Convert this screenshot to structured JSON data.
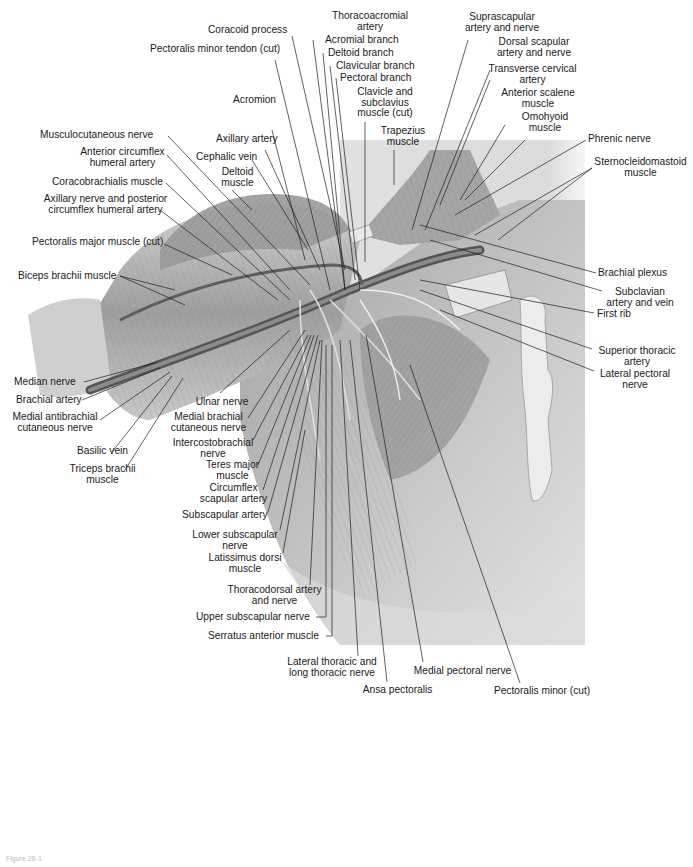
{
  "figure": {
    "caption_faint": "Figure 28-1"
  },
  "labels": [
    {
      "id": "thoracoacromial-artery",
      "text": "Thoracoacromial\nartery",
      "x": 330,
      "y": 11,
      "align": "c",
      "w": 80,
      "line": [
        [
          330,
          33
        ],
        [
          330,
          33
        ]
      ]
    },
    {
      "id": "coracoid-process",
      "text": "Coracoid process",
      "x": 208,
      "y": 25,
      "align": "r",
      "w": 110,
      "line": [
        [
          292,
          36
        ],
        [
          345,
          270
        ]
      ]
    },
    {
      "id": "pectoralis-minor-tendon-cut",
      "text": "Pectoralis minor tendon (cut)",
      "x": 150,
      "y": 44,
      "align": "r",
      "w": 140,
      "line": [
        [
          275,
          60
        ],
        [
          330,
          290
        ]
      ]
    },
    {
      "id": "acromial-branch",
      "text": "Acromial branch",
      "x": 325,
      "y": 35,
      "align": "r",
      "w": 100,
      "line": [
        [
          313,
          40
        ],
        [
          345,
          290
        ]
      ]
    },
    {
      "id": "deltoid-branch",
      "text": "Deltoid branch",
      "x": 328,
      "y": 48,
      "align": "r",
      "w": 100,
      "line": [
        [
          323,
          53
        ],
        [
          345,
          290
        ]
      ]
    },
    {
      "id": "clavicular-branch",
      "text": "Clavicular branch",
      "x": 336,
      "y": 61,
      "align": "r",
      "w": 100,
      "line": [
        [
          330,
          66
        ],
        [
          355,
          280
        ]
      ]
    },
    {
      "id": "pectoral-branch",
      "text": "Pectoral branch",
      "x": 340,
      "y": 73,
      "align": "r",
      "w": 100,
      "line": [
        [
          336,
          78
        ],
        [
          360,
          290
        ]
      ]
    },
    {
      "id": "acromion",
      "text": "Acromion",
      "x": 233,
      "y": 95,
      "align": "r",
      "w": 70,
      "line": [
        [
          272,
          130
        ],
        [
          305,
          260
        ]
      ]
    },
    {
      "id": "clavicle-subclavius-cut",
      "text": "Clavicle and\nsubclavius\nmuscle (cut)",
      "x": 345,
      "y": 87,
      "align": "c",
      "w": 80,
      "line": [
        [
          365,
          122
        ],
        [
          365,
          262
        ]
      ]
    },
    {
      "id": "trapezius-muscle",
      "text": "Trapezius\nmuscle",
      "x": 373,
      "y": 126,
      "align": "c",
      "w": 60,
      "line": [
        [
          394,
          150
        ],
        [
          394,
          185
        ]
      ]
    },
    {
      "id": "suprascapular-artery-nerve",
      "text": "Suprascapular\nartery and nerve",
      "x": 458,
      "y": 12,
      "align": "c",
      "w": 88,
      "line": [
        [
          468,
          40
        ],
        [
          412,
          230
        ]
      ]
    },
    {
      "id": "dorsal-scapular-artery-nerve",
      "text": "Dorsal scapular\nartery and nerve",
      "x": 490,
      "y": 37,
      "align": "c",
      "w": 88,
      "line": [
        [
          490,
          70
        ],
        [
          425,
          230
        ]
      ]
    },
    {
      "id": "transverse-cervical-artery",
      "text": "Transverse cervical\nartery",
      "x": 480,
      "y": 64,
      "align": "c",
      "w": 105,
      "line": [
        [
          490,
          80
        ],
        [
          440,
          205
        ]
      ]
    },
    {
      "id": "anterior-scalene-muscle",
      "text": "Anterior scalene\nmuscle",
      "x": 490,
      "y": 88,
      "align": "c",
      "w": 96,
      "line": [
        [
          505,
          125
        ],
        [
          460,
          200
        ]
      ]
    },
    {
      "id": "omohyoid-muscle",
      "text": "Omohyoid\nmuscle",
      "x": 510,
      "y": 112,
      "align": "c",
      "w": 70,
      "line": [
        [
          525,
          140
        ],
        [
          465,
          200
        ]
      ]
    },
    {
      "id": "phrenic-nerve",
      "text": "Phrenic nerve",
      "x": 588,
      "y": 134,
      "align": "r",
      "w": 90,
      "line": [
        [
          586,
          140
        ],
        [
          455,
          215
        ]
      ]
    },
    {
      "id": "sternocleidomastoid-muscle",
      "text": "Sternocleidomastoid\nmuscle",
      "x": 588,
      "y": 157,
      "align": "c",
      "w": 105,
      "line": [
        [
          592,
          168
        ],
        [
          475,
          235
        ]
      ],
      "line2": [
        [
          592,
          168
        ],
        [
          498,
          240
        ]
      ]
    },
    {
      "id": "musculocutaneous-nerve",
      "text": "Musculocutaneous nerve",
      "x": 40,
      "y": 130,
      "align": "r",
      "w": 130,
      "line": [
        [
          168,
          136
        ],
        [
          310,
          285
        ]
      ]
    },
    {
      "id": "anterior-circumflex-humeral-artery",
      "text": "Anterior circumflex\nhumeral artery",
      "x": 70,
      "y": 147,
      "align": "c",
      "w": 105,
      "line": [
        [
          167,
          155
        ],
        [
          290,
          290
        ]
      ]
    },
    {
      "id": "axillary-artery",
      "text": "Axillary artery",
      "x": 216,
      "y": 134,
      "align": "r",
      "w": 80,
      "line": [
        [
          265,
          150
        ],
        [
          320,
          270
        ]
      ]
    },
    {
      "id": "cephalic-vein",
      "text": "Cephalic vein",
      "x": 196,
      "y": 152,
      "align": "r",
      "w": 80,
      "line": [
        [
          252,
          160
        ],
        [
          308,
          250
        ]
      ]
    },
    {
      "id": "deltoid-muscle",
      "text": "Deltoid\nmuscle",
      "x": 210,
      "y": 167,
      "align": "c",
      "w": 55,
      "line": [
        [
          232,
          190
        ],
        [
          252,
          210
        ]
      ]
    },
    {
      "id": "coracobrachialis-muscle",
      "text": "Coracobrachialis muscle",
      "x": 52,
      "y": 177,
      "align": "r",
      "w": 120,
      "line": [
        [
          166,
          183
        ],
        [
          290,
          300
        ]
      ]
    },
    {
      "id": "axillary-nerve-posterior-circumflex",
      "text": "Axillary nerve and posterior\ncircumflex humeral artery",
      "x": 38,
      "y": 194,
      "align": "c",
      "w": 135,
      "line": [
        [
          160,
          210
        ],
        [
          278,
          300
        ]
      ]
    },
    {
      "id": "pectoralis-major-cut",
      "text": "Pectoralis major muscle (cut)",
      "x": 32,
      "y": 237,
      "align": "r",
      "w": 140,
      "line": [
        [
          164,
          244
        ],
        [
          232,
          275
        ]
      ]
    },
    {
      "id": "biceps-brachii-muscle",
      "text": "Biceps brachii muscle",
      "x": 18,
      "y": 271,
      "align": "r",
      "w": 110,
      "line": [
        [
          120,
          276
        ],
        [
          175,
          290
        ]
      ],
      "line2": [
        [
          120,
          276
        ],
        [
          185,
          305
        ]
      ]
    },
    {
      "id": "brachial-plexus",
      "text": "Brachial plexus",
      "x": 598,
      "y": 268,
      "align": "r",
      "w": 90,
      "line": [
        [
          596,
          273
        ],
        [
          420,
          225
        ]
      ]
    },
    {
      "id": "subclavian-artery-vein",
      "text": "Subclavian\nartery and vein",
      "x": 595,
      "y": 287,
      "align": "c",
      "w": 90,
      "line": [
        [
          602,
          291
        ],
        [
          430,
          240
        ]
      ]
    },
    {
      "id": "first-rib",
      "text": "First rib",
      "x": 597,
      "y": 309,
      "align": "r",
      "w": 50,
      "line": [
        [
          594,
          313
        ],
        [
          420,
          280
        ]
      ]
    },
    {
      "id": "superior-thoracic-artery",
      "text": "Superior thoracic\nartery",
      "x": 588,
      "y": 346,
      "align": "c",
      "w": 98,
      "line": [
        [
          592,
          349
        ],
        [
          420,
          290
        ]
      ]
    },
    {
      "id": "lateral-pectoral-nerve",
      "text": "Lateral pectoral\nnerve",
      "x": 590,
      "y": 369,
      "align": "c",
      "w": 90,
      "line": [
        [
          594,
          371
        ],
        [
          440,
          310
        ]
      ]
    },
    {
      "id": "median-nerve",
      "text": "Median nerve",
      "x": 14,
      "y": 377,
      "align": "r",
      "w": 70,
      "line": [
        [
          84,
          382
        ],
        [
          158,
          362
        ]
      ]
    },
    {
      "id": "brachial-artery",
      "text": "Brachial artery",
      "x": 16,
      "y": 395,
      "align": "r",
      "w": 70,
      "line": [
        [
          82,
          400
        ],
        [
          160,
          368
        ]
      ]
    },
    {
      "id": "medial-antibrachial-cutaneous-nerve",
      "text": "Medial antibrachial\ncutaneous nerve",
      "x": 10,
      "y": 412,
      "align": "c",
      "w": 90,
      "line": [
        [
          100,
          420
        ],
        [
          170,
          372
        ]
      ]
    },
    {
      "id": "basilic-vein",
      "text": "Basilic vein",
      "x": 70,
      "y": 446,
      "align": "c",
      "w": 65,
      "line": [
        [
          112,
          452
        ],
        [
          172,
          376
        ]
      ]
    },
    {
      "id": "triceps-brachii-muscle",
      "text": "Triceps brachii\nmuscle",
      "x": 60,
      "y": 464,
      "align": "c",
      "w": 85,
      "line": [
        [
          125,
          470
        ],
        [
          183,
          378
        ]
      ]
    },
    {
      "id": "ulnar-nerve",
      "text": "Ulnar nerve",
      "x": 187,
      "y": 397,
      "align": "c",
      "w": 70,
      "line": [
        [
          220,
          393
        ],
        [
          290,
          330
        ]
      ]
    },
    {
      "id": "medial-brachial-cutaneous-nerve",
      "text": "Medial brachial\ncutaneous nerve",
      "x": 166,
      "y": 412,
      "align": "c",
      "w": 85,
      "line": [
        [
          248,
          418
        ],
        [
          305,
          330
        ]
      ]
    },
    {
      "id": "intercostobrachial-nerve",
      "text": "Intercostobrachial\nnerve",
      "x": 168,
      "y": 438,
      "align": "c",
      "w": 90,
      "line": [
        [
          253,
          440
        ],
        [
          308,
          335
        ]
      ]
    },
    {
      "id": "teres-major-muscle",
      "text": "Teres major\nmuscle",
      "x": 200,
      "y": 460,
      "align": "c",
      "w": 65,
      "line": [
        [
          258,
          465
        ],
        [
          311,
          335
        ]
      ]
    },
    {
      "id": "circumflex-scapular-artery",
      "text": "Circumflex\nscapular artery",
      "x": 196,
      "y": 483,
      "align": "c",
      "w": 75,
      "line": [
        [
          263,
          490
        ],
        [
          314,
          335
        ]
      ]
    },
    {
      "id": "subscapular-artery",
      "text": "Subscapular artery",
      "x": 182,
      "y": 510,
      "align": "r",
      "w": 95,
      "line": [
        [
          268,
          512
        ],
        [
          318,
          335
        ]
      ]
    },
    {
      "id": "lower-subscapular-nerve",
      "text": "Lower subscapular\nnerve",
      "x": 190,
      "y": 530,
      "align": "c",
      "w": 90,
      "line": [
        [
          280,
          530
        ],
        [
          320,
          340
        ]
      ]
    },
    {
      "id": "latissimus-dorsi-muscle",
      "text": "Latissimus dorsi\nmuscle",
      "x": 205,
      "y": 553,
      "align": "c",
      "w": 80,
      "line": [
        [
          283,
          553
        ],
        [
          305,
          430
        ]
      ]
    },
    {
      "id": "thoracodorsal-artery-nerve",
      "text": "Thoracodorsal artery\nand nerve",
      "x": 222,
      "y": 585,
      "align": "c",
      "w": 105,
      "line": [
        [
          310,
          585
        ],
        [
          322,
          340
        ]
      ]
    },
    {
      "id": "upper-subscapular-nerve",
      "text": "Upper subscapular nerve",
      "x": 196,
      "y": 612,
      "align": "r",
      "w": 120,
      "line": [
        [
          316,
          617
        ],
        [
          326,
          617
        ],
        [
          326,
          345
        ]
      ]
    },
    {
      "id": "serratus-anterior-muscle",
      "text": "Serratus anterior muscle",
      "x": 208,
      "y": 631,
      "align": "r",
      "w": 120,
      "line": [
        [
          326,
          636
        ],
        [
          332,
          636
        ],
        [
          332,
          345
        ]
      ]
    },
    {
      "id": "lateral-thoracic-long-thoracic-nerve",
      "text": "Lateral thoracic and\nlong thoracic nerve",
      "x": 282,
      "y": 657,
      "align": "c",
      "w": 100,
      "line": [
        [
          358,
          656
        ],
        [
          340,
          340
        ]
      ]
    },
    {
      "id": "ansa-pectoralis",
      "text": "Ansa pectoralis",
      "x": 355,
      "y": 685,
      "align": "c",
      "w": 85,
      "line": [
        [
          387,
          682
        ],
        [
          350,
          340
        ]
      ]
    },
    {
      "id": "medial-pectoral-nerve",
      "text": "Medial pectoral nerve",
      "x": 405,
      "y": 666,
      "align": "c",
      "w": 115,
      "line": [
        [
          423,
          662
        ],
        [
          366,
          335
        ]
      ]
    },
    {
      "id": "pectoralis-minor-cut",
      "text": "Pectoralis minor (cut)",
      "x": 487,
      "y": 686,
      "align": "c",
      "w": 110,
      "line": [
        [
          520,
          683
        ],
        [
          410,
          365
        ]
      ]
    }
  ],
  "colors": {
    "background": "#ffffff",
    "skin_light": "#e9e9e9",
    "skin_mid": "#bdbdbd",
    "muscle_dark": "#8a8a8a",
    "vessel": "#5a5a5a",
    "label_text": "#1a1a1a",
    "leader_line": "#1e1e1e"
  }
}
